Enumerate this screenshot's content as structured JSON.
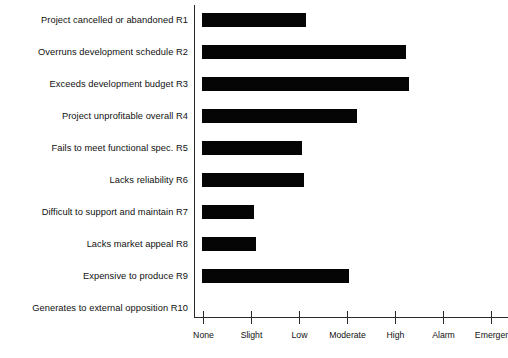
{
  "chart_data": {
    "type": "bar",
    "orientation": "horizontal",
    "title": "",
    "xlabel": "",
    "ylabel": "",
    "grid": false,
    "legend": null,
    "xticklabels": [
      "None",
      "Slight",
      "Low",
      "Moderate",
      "High",
      "Alarm",
      "Emerger"
    ],
    "xtickvalues": [
      0,
      1,
      2,
      3,
      4,
      5,
      6
    ],
    "xlim": [
      0,
      6.5
    ],
    "categories": [
      "Project cancelled or abandoned R1",
      "Overruns development schedule R2",
      "Exceeds development budget R3",
      "Project unprofitable overall R4",
      "Fails to meet functional spec. R5",
      "Lacks reliability R6",
      "Difficult to support and maintain R7",
      "Lacks market appeal R8",
      "Expensive to produce R9",
      "Generates to external opposition R10"
    ],
    "values": [
      2.17,
      4.25,
      4.31,
      3.23,
      2.08,
      2.12,
      1.08,
      1.13,
      3.06,
      0
    ],
    "bar_color": "#050505",
    "axis_color": "#2b2b2b"
  }
}
